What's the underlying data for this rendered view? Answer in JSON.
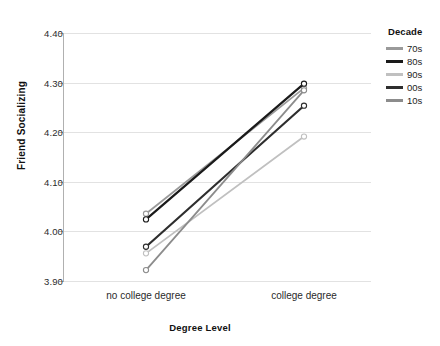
{
  "chart_data": {
    "type": "line",
    "title": "",
    "xlabel": "Degree Level",
    "ylabel": "Friend Socializing",
    "categories": [
      "no college degree",
      "college degree"
    ],
    "ylim": [
      3.875,
      4.44
    ],
    "yticks": [
      "3.90",
      "4.00",
      "4.10",
      "4.20",
      "4.30",
      "4.40"
    ],
    "ytick_values": [
      3.9,
      4.0,
      4.1,
      4.2,
      4.3,
      4.4
    ],
    "grid": true,
    "legend_position": "right",
    "legend_title": "Decade",
    "series": [
      {
        "name": "70s",
        "values": [
          4.03,
          4.315
        ],
        "color": "#9a9a9a"
      },
      {
        "name": "80s",
        "values": [
          4.017,
          4.325
        ],
        "color": "#1a1a1a"
      },
      {
        "name": "90s",
        "values": [
          3.94,
          4.205
        ],
        "color": "#c0c0c0"
      },
      {
        "name": "00s",
        "values": [
          3.955,
          4.275
        ],
        "color": "#2e2e2e"
      },
      {
        "name": "10s",
        "values": [
          3.902,
          4.31
        ],
        "color": "#8c8c8c"
      }
    ]
  },
  "legend": {
    "title": "Decade",
    "items": [
      {
        "label": "70s",
        "color": "#9a9a9a"
      },
      {
        "label": "80s",
        "color": "#1a1a1a"
      },
      {
        "label": "90s",
        "color": "#c0c0c0"
      },
      {
        "label": "00s",
        "color": "#2e2e2e"
      },
      {
        "label": "10s",
        "color": "#8c8c8c"
      }
    ]
  },
  "axes": {
    "y_title": "Friend Socializing",
    "x_title": "Degree Level",
    "y_tick_labels": [
      "4.40",
      "4.30",
      "4.20",
      "4.10",
      "4.00",
      "3.90"
    ],
    "x_tick_labels": [
      "no college degree",
      "college degree"
    ]
  },
  "colors": {
    "gridline": "#e2e2e2",
    "axis": "#9a9a9a",
    "text": "#1a1a1a",
    "background": "#ffffff",
    "marker_fill": "#ffffff"
  }
}
